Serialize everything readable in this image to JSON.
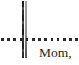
{
  "page": {
    "signature_text": "Mom,",
    "colors": {
      "paper": "#ffffff",
      "ink": "#1f1f1f",
      "dotted_line": "#2a2a2a",
      "rule_dark": "#2e2e2e",
      "rule_light": "#929292"
    }
  }
}
